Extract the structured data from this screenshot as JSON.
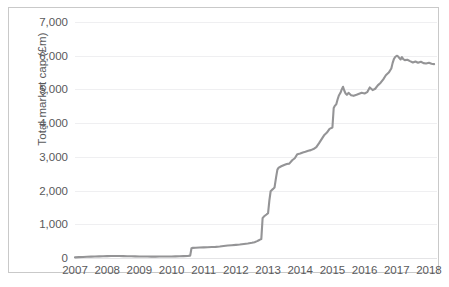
{
  "chart_data": {
    "type": "line",
    "title": "",
    "xlabel": "",
    "ylabel": "Total market cap (£m)",
    "xlim": [
      2007,
      2018.25
    ],
    "ylim": [
      0,
      7000
    ],
    "grid": true,
    "legend": false,
    "line_color": "#949496",
    "ytick_labels": [
      "7,000",
      "6,000",
      "5,000",
      "4,000",
      "3,000",
      "2,000",
      "1,000",
      "0"
    ],
    "ytick_values": [
      7000,
      6000,
      5000,
      4000,
      3000,
      2000,
      1000,
      0
    ],
    "xtick_labels": [
      "2007",
      "2008",
      "2009",
      "2010",
      "2011",
      "2012",
      "2013",
      "2014",
      "2015",
      "2016",
      "2017",
      "2018"
    ],
    "xtick_values": [
      2007,
      2008,
      2009,
      2010,
      2011,
      2012,
      2013,
      2014,
      2015,
      2016,
      2017,
      2018
    ],
    "series": [
      {
        "name": "Total market cap",
        "x": [
          2007.0,
          2007.12,
          2007.25,
          2007.37,
          2007.5,
          2007.62,
          2007.75,
          2007.87,
          2008.0,
          2008.12,
          2008.25,
          2008.37,
          2008.5,
          2008.62,
          2008.75,
          2008.87,
          2009.0,
          2009.12,
          2009.25,
          2009.37,
          2009.5,
          2009.62,
          2009.75,
          2009.87,
          2010.0,
          2010.12,
          2010.25,
          2010.37,
          2010.5,
          2010.58,
          2010.62,
          2010.66,
          2010.75,
          2010.87,
          2011.0,
          2011.12,
          2011.25,
          2011.37,
          2011.5,
          2011.62,
          2011.75,
          2011.87,
          2012.0,
          2012.12,
          2012.25,
          2012.37,
          2012.5,
          2012.58,
          2012.66,
          2012.7,
          2012.75,
          2012.79,
          2012.83,
          2012.87,
          2012.91,
          2012.95,
          2013.0,
          2013.04,
          2013.08,
          2013.12,
          2013.16,
          2013.2,
          2013.25,
          2013.29,
          2013.33,
          2013.37,
          2013.41,
          2013.5,
          2013.58,
          2013.66,
          2013.75,
          2013.83,
          2013.91,
          2014.0,
          2014.08,
          2014.16,
          2014.25,
          2014.33,
          2014.41,
          2014.5,
          2014.58,
          2014.66,
          2014.75,
          2014.83,
          2014.91,
          2015.0,
          2015.04,
          2015.08,
          2015.12,
          2015.16,
          2015.2,
          2015.25,
          2015.29,
          2015.33,
          2015.37,
          2015.41,
          2015.45,
          2015.5,
          2015.58,
          2015.66,
          2015.75,
          2015.83,
          2015.91,
          2016.0,
          2016.08,
          2016.16,
          2016.25,
          2016.33,
          2016.41,
          2016.5,
          2016.58,
          2016.66,
          2016.75,
          2016.83,
          2016.87,
          2016.91,
          2016.95,
          2017.0,
          2017.04,
          2017.08,
          2017.12,
          2017.16,
          2017.2,
          2017.25,
          2017.33,
          2017.41,
          2017.5,
          2017.58,
          2017.66,
          2017.75,
          2017.83,
          2017.91,
          2018.0,
          2018.08,
          2018.16
        ],
        "y": [
          20,
          25,
          30,
          35,
          40,
          45,
          48,
          50,
          55,
          58,
          60,
          58,
          55,
          52,
          50,
          48,
          45,
          44,
          43,
          42,
          42,
          43,
          44,
          45,
          46,
          48,
          50,
          55,
          60,
          70,
          290,
          300,
          305,
          310,
          315,
          320,
          325,
          330,
          340,
          355,
          370,
          380,
          390,
          400,
          415,
          430,
          450,
          470,
          500,
          520,
          545,
          560,
          1180,
          1230,
          1260,
          1290,
          1330,
          1700,
          1980,
          2020,
          2050,
          2090,
          2400,
          2620,
          2680,
          2700,
          2720,
          2760,
          2790,
          2800,
          2900,
          2960,
          3080,
          3100,
          3130,
          3150,
          3180,
          3200,
          3230,
          3290,
          3400,
          3520,
          3650,
          3720,
          3830,
          3870,
          4450,
          4520,
          4560,
          4700,
          4820,
          4900,
          5000,
          5080,
          4960,
          4880,
          4840,
          4900,
          4830,
          4810,
          4840,
          4870,
          4900,
          4880,
          4920,
          5060,
          4980,
          5020,
          5120,
          5200,
          5300,
          5420,
          5500,
          5620,
          5780,
          5900,
          5960,
          6000,
          5980,
          5930,
          5890,
          5960,
          5900,
          5870,
          5880,
          5840,
          5800,
          5830,
          5790,
          5820,
          5780,
          5770,
          5790,
          5760,
          5750
        ]
      }
    ]
  }
}
